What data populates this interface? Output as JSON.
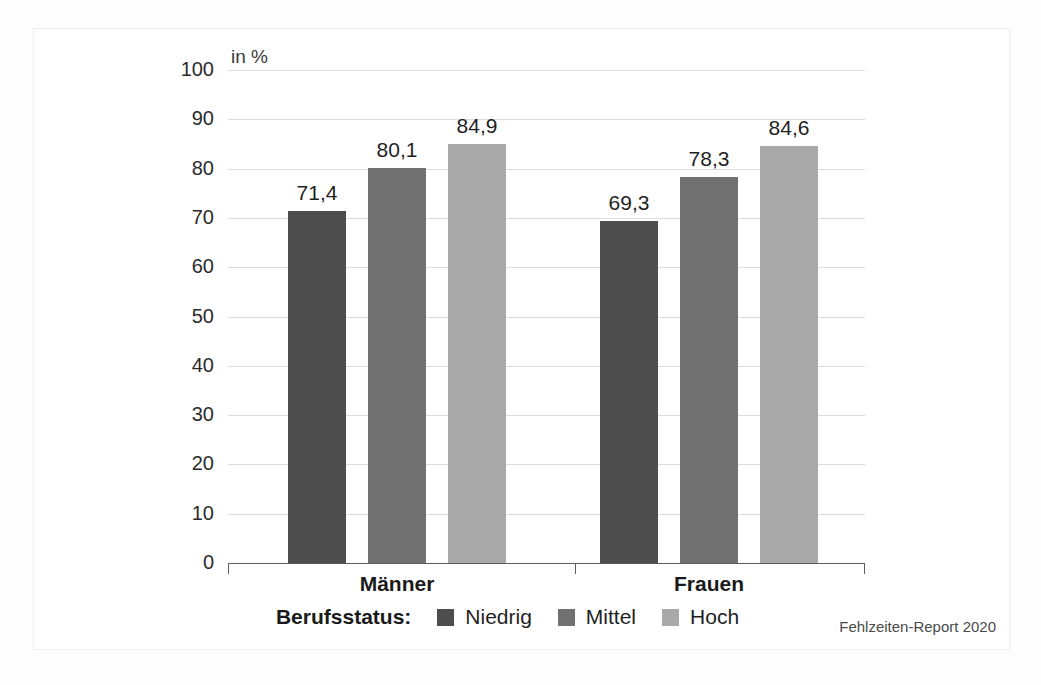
{
  "chart_data": {
    "type": "bar",
    "title": "",
    "axis_title": "in %",
    "xlabel": "",
    "ylabel": "in %",
    "ylim": [
      0,
      100
    ],
    "yticks": [
      100,
      90,
      80,
      70,
      60,
      50,
      40,
      30,
      20,
      10,
      0
    ],
    "ytick_labels": [
      "100",
      "90",
      "80",
      "70",
      "60",
      "50",
      "40",
      "30",
      "20",
      "10",
      "0"
    ],
    "grid": true,
    "legend_position": "bottom-center",
    "legend_title": "Berufsstatus:",
    "categories": [
      "Männer",
      "Frauen"
    ],
    "series": [
      {
        "name": "Niedrig",
        "color": "#4d4d4d",
        "values": [
          71.4,
          69.3
        ],
        "labels": [
          "71,4",
          "69,3"
        ]
      },
      {
        "name": "Mittel",
        "color": "#717171",
        "values": [
          80.1,
          78.3
        ],
        "labels": [
          "80,1",
          "78,3"
        ]
      },
      {
        "name": "Hoch",
        "color": "#a9a9a9",
        "values": [
          84.9,
          84.6
        ],
        "labels": [
          "84,9",
          "84,6"
        ]
      }
    ],
    "source_note": "Fehlzeiten-Report 2020"
  },
  "legend": {
    "title": "Berufsstatus:",
    "items": [
      {
        "label": "Niedrig",
        "color": "#4d4d4d"
      },
      {
        "label": "Mittel",
        "color": "#717171"
      },
      {
        "label": "Hoch",
        "color": "#a9a9a9"
      }
    ]
  },
  "axis": {
    "title": "in %",
    "ticks": [
      "100",
      "90",
      "80",
      "70",
      "60",
      "50",
      "40",
      "30",
      "20",
      "10",
      "0"
    ]
  },
  "groups": [
    {
      "label": "Männer"
    },
    {
      "label": "Frauen"
    }
  ],
  "bars": [
    {
      "group": "Männer",
      "series": "Niedrig",
      "value": 71.4,
      "label": "71,4"
    },
    {
      "group": "Männer",
      "series": "Mittel",
      "value": 80.1,
      "label": "80,1"
    },
    {
      "group": "Männer",
      "series": "Hoch",
      "value": 84.9,
      "label": "84,9"
    },
    {
      "group": "Frauen",
      "series": "Niedrig",
      "value": 69.3,
      "label": "69,3"
    },
    {
      "group": "Frauen",
      "series": "Mittel",
      "value": 78.3,
      "label": "78,3"
    },
    {
      "group": "Frauen",
      "series": "Hoch",
      "value": 84.6,
      "label": "84,6"
    }
  ],
  "footer": {
    "source": "Fehlzeiten-Report 2020"
  }
}
